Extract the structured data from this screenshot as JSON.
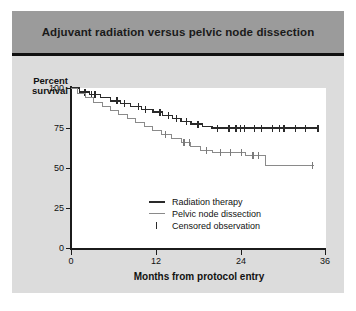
{
  "figure": {
    "title": "Adjuvant radiation versus pelvic node dissection",
    "background_color": "#dcdcdc",
    "title_bar_color": "#9b9b9b"
  },
  "chart_data": {
    "type": "line",
    "title": "Adjuvant radiation versus pelvic node dissection",
    "subtitle": "",
    "xlabel": "Months from protocol entry",
    "ylabel": "Percent survival",
    "ylabel_lines": [
      "Percent",
      "survival"
    ],
    "xlim": [
      0,
      36
    ],
    "ylim": [
      0,
      100
    ],
    "xticks": [
      0,
      12,
      24,
      36
    ],
    "xtick_labels": [
      "0",
      "12",
      "24",
      "36"
    ],
    "yticks": [
      0,
      25,
      50,
      75,
      100
    ],
    "ytick_labels": [
      "0",
      "25",
      "50",
      "75",
      "100"
    ],
    "grid": false,
    "legend_position": "lower center",
    "legend": [
      {
        "label": "Radiation therapy",
        "key": "thick-line",
        "color": "#2a2a2a"
      },
      {
        "label": "Pelvic node dissection",
        "key": "thin-line",
        "color": "#8a8a8a"
      },
      {
        "label": "Censored observation",
        "key": "tick-mark",
        "color": "#2a2a2a"
      }
    ],
    "series": [
      {
        "name": "Radiation therapy",
        "style": "step",
        "color": "#2a2a2a",
        "line_width": 1.4,
        "points": [
          [
            0,
            100
          ],
          [
            1.2,
            100
          ],
          [
            1.2,
            97.5
          ],
          [
            2.6,
            97.5
          ],
          [
            2.6,
            96.0
          ],
          [
            4.2,
            96.0
          ],
          [
            4.2,
            94.0
          ],
          [
            5.6,
            94.0
          ],
          [
            5.6,
            92.0
          ],
          [
            7.0,
            92.0
          ],
          [
            7.0,
            90.5
          ],
          [
            8.4,
            90.5
          ],
          [
            8.4,
            88.5
          ],
          [
            10.0,
            88.5
          ],
          [
            10.0,
            86.5
          ],
          [
            11.6,
            86.5
          ],
          [
            11.6,
            85.0
          ],
          [
            13.0,
            85.0
          ],
          [
            13.0,
            83.0
          ],
          [
            14.4,
            83.0
          ],
          [
            14.4,
            81.0
          ],
          [
            15.6,
            81.0
          ],
          [
            15.6,
            79.0
          ],
          [
            17.0,
            79.0
          ],
          [
            17.0,
            77.5
          ],
          [
            18.6,
            77.5
          ],
          [
            18.6,
            76.0
          ],
          [
            20.0,
            76.0
          ],
          [
            20.0,
            75.0
          ],
          [
            35.2,
            75.0
          ]
        ],
        "censored": [
          [
            2.0,
            97.5
          ],
          [
            2.9,
            96.0
          ],
          [
            3.4,
            96.0
          ],
          [
            6.5,
            92.0
          ],
          [
            7.6,
            90.5
          ],
          [
            9.6,
            88.5
          ],
          [
            10.6,
            86.5
          ],
          [
            12.6,
            85.0
          ],
          [
            13.8,
            83.0
          ],
          [
            15.0,
            81.0
          ],
          [
            16.4,
            79.0
          ],
          [
            18.0,
            77.5
          ],
          [
            20.8,
            75.0
          ],
          [
            22.4,
            75.0
          ],
          [
            23.4,
            75.0
          ],
          [
            24.0,
            75.0
          ],
          [
            24.6,
            75.0
          ],
          [
            26.0,
            75.0
          ],
          [
            27.0,
            75.0
          ],
          [
            28.6,
            75.0
          ],
          [
            29.6,
            75.0
          ],
          [
            30.2,
            75.0
          ],
          [
            31.8,
            75.0
          ],
          [
            33.2,
            75.0
          ],
          [
            35.0,
            75.0
          ]
        ]
      },
      {
        "name": "Pelvic node dissection",
        "style": "step",
        "color": "#8a8a8a",
        "line_width": 1.0,
        "points": [
          [
            0,
            100
          ],
          [
            0.9,
            100
          ],
          [
            0.9,
            96.5
          ],
          [
            2.0,
            96.5
          ],
          [
            2.0,
            94.0
          ],
          [
            3.2,
            94.0
          ],
          [
            3.2,
            91.0
          ],
          [
            4.4,
            91.0
          ],
          [
            4.4,
            88.5
          ],
          [
            5.6,
            88.5
          ],
          [
            5.6,
            86.0
          ],
          [
            6.8,
            86.0
          ],
          [
            6.8,
            83.5
          ],
          [
            8.0,
            83.5
          ],
          [
            8.0,
            81.0
          ],
          [
            9.2,
            81.0
          ],
          [
            9.2,
            78.5
          ],
          [
            10.4,
            78.5
          ],
          [
            10.4,
            76.0
          ],
          [
            11.6,
            76.0
          ],
          [
            11.6,
            73.5
          ],
          [
            12.8,
            73.5
          ],
          [
            12.8,
            71.0
          ],
          [
            14.2,
            71.0
          ],
          [
            14.2,
            68.5
          ],
          [
            15.6,
            68.5
          ],
          [
            15.6,
            66.0
          ],
          [
            17.0,
            66.0
          ],
          [
            17.0,
            63.5
          ],
          [
            18.4,
            63.5
          ],
          [
            18.4,
            61.0
          ],
          [
            20.0,
            61.0
          ],
          [
            20.0,
            59.5
          ],
          [
            24.8,
            59.5
          ],
          [
            24.8,
            58.0
          ],
          [
            27.6,
            58.0
          ],
          [
            27.6,
            51.5
          ],
          [
            34.4,
            51.5
          ]
        ],
        "censored": [
          [
            13.4,
            71.0
          ],
          [
            16.0,
            66.0
          ],
          [
            16.8,
            66.0
          ],
          [
            19.2,
            61.0
          ],
          [
            21.2,
            59.5
          ],
          [
            22.6,
            59.5
          ],
          [
            24.2,
            59.5
          ],
          [
            25.8,
            58.0
          ],
          [
            26.6,
            58.0
          ],
          [
            34.2,
            51.5
          ]
        ]
      }
    ]
  }
}
